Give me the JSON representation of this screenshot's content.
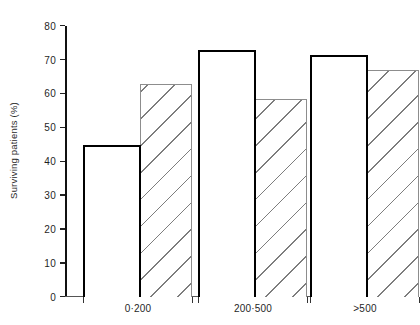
{
  "chart_data": {
    "type": "bar",
    "title": "",
    "subtitle": "",
    "xlabel": "",
    "ylabel": "Surviving patients (%)",
    "categories": [
      "0·200",
      "200·500",
      ">500"
    ],
    "series": [
      {
        "name": "open-bar-series",
        "style": "open white bar with thick black outline",
        "values": [
          45,
          73,
          71.5
        ]
      },
      {
        "name": "hatched-bar-series",
        "style": "diagonally hatched bar with thin grey outline",
        "values": [
          63,
          58.5,
          67
        ]
      }
    ],
    "ylim": [
      0,
      80
    ],
    "yticks": [
      0,
      10,
      20,
      30,
      40,
      50,
      60,
      70,
      80
    ],
    "ytick_labels": [
      "0",
      "10",
      "20",
      "30",
      "40",
      "50",
      "60",
      "70",
      "80"
    ],
    "grid": false,
    "legend": false,
    "legend_position": "none",
    "annotations": []
  },
  "axis": {
    "y_title": "Surviving patients (%)"
  }
}
